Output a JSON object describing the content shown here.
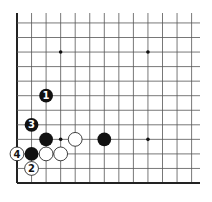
{
  "diagram": {
    "type": "go-board-fragment",
    "visible_columns": 13,
    "visible_rows": 12,
    "edges": [
      "left",
      "bottom"
    ],
    "star_points": [
      [
        3,
        3
      ],
      [
        9,
        3
      ],
      [
        3,
        9
      ],
      [
        9,
        9
      ]
    ],
    "stones": [
      {
        "color": "black",
        "col": 2,
        "row": 6,
        "label": "1"
      },
      {
        "color": "black",
        "col": 1,
        "row": 4,
        "label": "3"
      },
      {
        "color": "black",
        "col": 2,
        "row": 3,
        "label": ""
      },
      {
        "color": "white",
        "col": 4,
        "row": 3,
        "label": ""
      },
      {
        "color": "black",
        "col": 6,
        "row": 3,
        "label": ""
      },
      {
        "color": "black",
        "col": 1,
        "row": 2,
        "label": ""
      },
      {
        "color": "white",
        "col": 2,
        "row": 2,
        "label": ""
      },
      {
        "color": "white",
        "col": 3,
        "row": 2,
        "label": ""
      },
      {
        "color": "white",
        "col": 0,
        "row": 2,
        "label": "4"
      },
      {
        "color": "white",
        "col": 1,
        "row": 1,
        "label": "2"
      }
    ],
    "colors": {
      "line": "#555555",
      "edge": "#222222",
      "black": "#111111",
      "white": "#ffffff",
      "star": "#111111"
    }
  }
}
